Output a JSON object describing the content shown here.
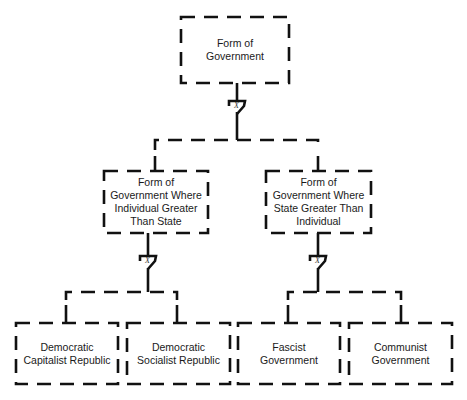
{
  "diagram": {
    "type": "fault-tree",
    "stroke_color": "#111111",
    "background": "#ffffff",
    "root": {
      "id": "root",
      "label": "Form of\nGovernment"
    },
    "gates": [
      {
        "id": "gate-root",
        "label": "X",
        "type": "exclusive-or"
      },
      {
        "id": "gate-left",
        "label": "X",
        "type": "exclusive-or"
      },
      {
        "id": "gate-right",
        "label": "X",
        "type": "exclusive-or"
      }
    ],
    "level1": [
      {
        "id": "individual",
        "label": "Form of\nGovernment Where\nIndividual Greater\nThan State"
      },
      {
        "id": "state",
        "label": "Form of\nGovernment Where\nState Greater Than\nIndividual"
      }
    ],
    "level2": [
      {
        "id": "dem-cap",
        "parent": "individual",
        "label": "Democratic\nCapitalist Republic"
      },
      {
        "id": "dem-soc",
        "parent": "individual",
        "label": "Democratic\nSocialist Republic"
      },
      {
        "id": "fascist",
        "parent": "state",
        "label": "Fascist\nGovernment"
      },
      {
        "id": "communist",
        "parent": "state",
        "label": "Communist\nGovernment"
      }
    ]
  }
}
